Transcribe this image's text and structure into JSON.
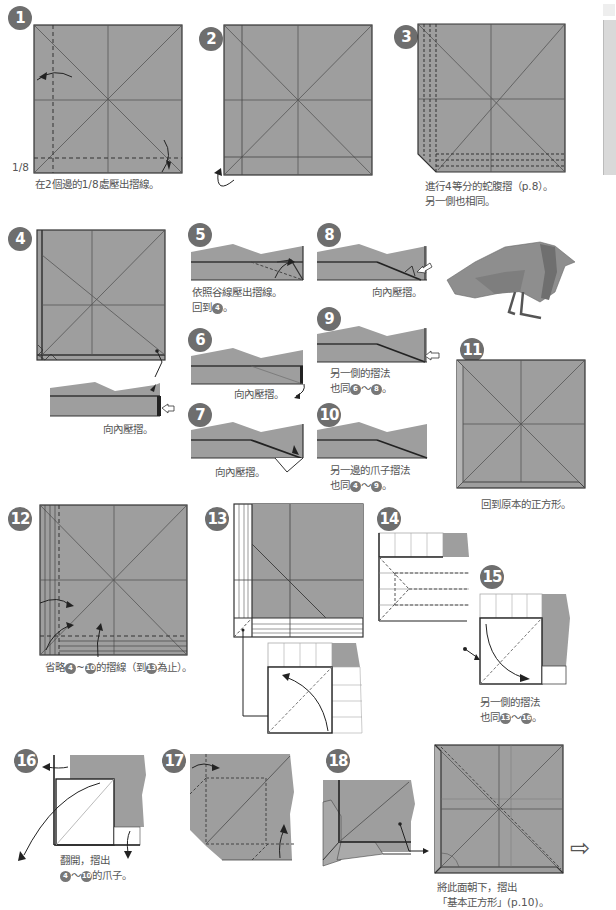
{
  "colors": {
    "paper": "#9e9e9e",
    "paper_light": "#b0b0b0",
    "line": "#333333",
    "badge": "#6e6e6e",
    "white": "#ffffff"
  },
  "steps": [
    {
      "number": "1",
      "caption": "在2個邊的1/8處壓出摺線。",
      "label_fraction": "1/8"
    },
    {
      "number": "2",
      "caption": ""
    },
    {
      "number": "3",
      "caption_lines": [
        "進行4等分的蛇腹摺（p.8）。",
        "另一側也相同。"
      ]
    },
    {
      "number": "4",
      "caption": "向內壓摺。"
    },
    {
      "number": "5",
      "caption_lines": [
        "依照谷線壓出摺線。",
        "回到"
      ],
      "ref": "4"
    },
    {
      "number": "6",
      "caption": "向內壓摺。"
    },
    {
      "number": "7",
      "caption": "向內壓摺。"
    },
    {
      "number": "8",
      "caption": "向內壓摺。"
    },
    {
      "number": "9",
      "caption_lines": [
        "另一側的摺法",
        "也同"
      ],
      "ref_from": "6",
      "ref_to": "8"
    },
    {
      "number": "10",
      "caption_lines": [
        "另一邊的爪子摺法",
        "也同"
      ],
      "ref_from": "4",
      "ref_to": "9"
    },
    {
      "number": "11",
      "caption": "回到原本的正方形。"
    },
    {
      "number": "12",
      "caption_parts": [
        "省略",
        "4",
        "~",
        "10",
        "的摺線（到",
        "13",
        "為止）。"
      ]
    },
    {
      "number": "13",
      "caption": ""
    },
    {
      "number": "14",
      "caption": ""
    },
    {
      "number": "15",
      "caption_lines": [
        "另一側的摺法",
        "也同"
      ],
      "ref_from": "13",
      "ref_to": "16"
    },
    {
      "number": "16",
      "caption_lines": [
        "翻開，摺出",
        "的爪子。"
      ],
      "ref_from": "4",
      "ref_to": "10"
    },
    {
      "number": "17",
      "caption": ""
    },
    {
      "number": "18",
      "caption": ""
    },
    {
      "number": "19",
      "caption_lines": [
        "將此面朝下，摺出",
        "「基本正方形」(p.10)。"
      ]
    }
  ],
  "symbols": {
    "tilde": "～",
    "period": "。",
    "next_arrow": "⇨"
  }
}
